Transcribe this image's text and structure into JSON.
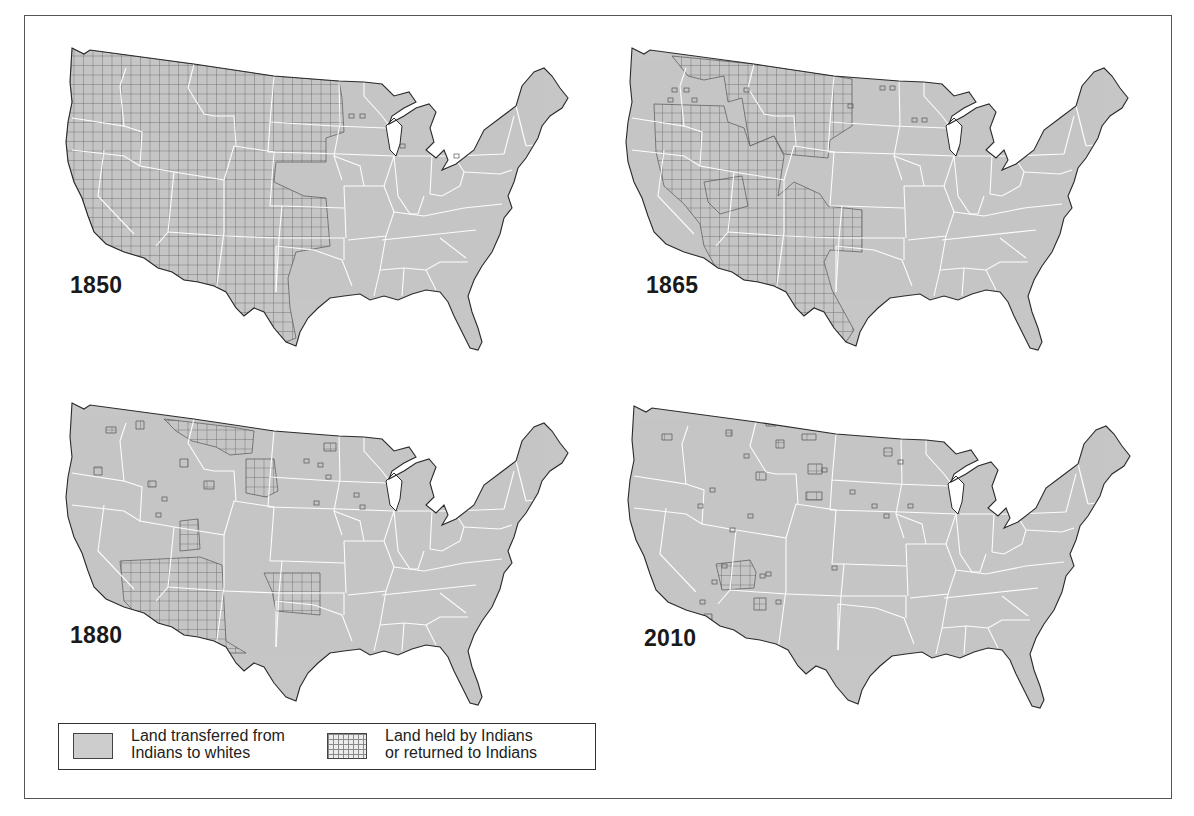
{
  "colors": {
    "land_fill": "#c6c6c6",
    "hatch_line": "#6e6e6e",
    "state_border": "#ffffff",
    "coast_outline": "#2a2a2a",
    "frame": "#555555"
  },
  "panels": [
    {
      "id": "map-1850",
      "year": "1850"
    },
    {
      "id": "map-1865",
      "year": "1865"
    },
    {
      "id": "map-1880",
      "year": "1880"
    },
    {
      "id": "map-2010",
      "year": "2010"
    }
  ],
  "legend": {
    "items": [
      {
        "swatch": "solid-gray",
        "line1": "Land transferred from",
        "line2": "Indians to whites"
      },
      {
        "swatch": "grid-hatch",
        "line1": "Land held by Indians",
        "line2": "or returned to Indians"
      }
    ]
  },
  "chart_data": {
    "type": "choropleth-map-series",
    "title": "",
    "region": "Contiguous United States",
    "categories": [
      "Land transferred from Indians to whites",
      "Land held by Indians or returned to Indians"
    ],
    "maps": [
      {
        "year": "1850",
        "indian_held_extent": "Nearly all land west of Minnesota/Iowa/Missouri/Arkansas and western Texas; small enclaves in Wisconsin, Michigan, New York"
      },
      {
        "year": "1865",
        "indian_held_extent": "Large areas of Great Plains, Great Basin, Southwest and interior Northwest; reduced from 1850"
      },
      {
        "year": "1880",
        "indian_held_extent": "Scattered reservations; larger blocks in Arizona/New Mexico/Utah, Indian Territory (Oklahoma), Dakota and Montana"
      },
      {
        "year": "2010",
        "indian_held_extent": "Small scattered reservations; largest block is Navajo Nation in Arizona/New Mexico"
      }
    ]
  }
}
